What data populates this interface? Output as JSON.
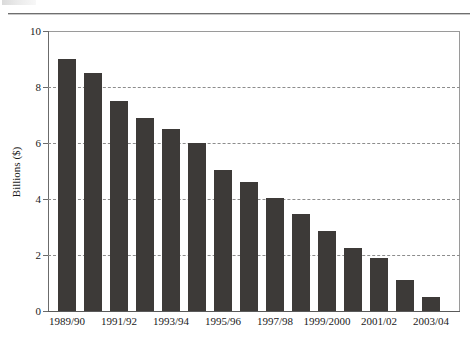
{
  "figure": {
    "background_color": "#ffffff",
    "bar_color": "#3d3a38",
    "grid_color": "#8d8d8d",
    "axis_color": "#6b6b6b"
  },
  "chart_data": {
    "type": "bar",
    "title": "",
    "subtitle": "",
    "xlabel": "",
    "ylabel": "Billions ($)",
    "ylim": [
      0,
      10
    ],
    "yticks": [
      0,
      2,
      4,
      6,
      8,
      10
    ],
    "ytick_labels": [
      "0",
      "2",
      "4",
      "6",
      "8",
      "10"
    ],
    "grid": "horizontal-dashed",
    "legend": "none",
    "categories": [
      "1989/90",
      "1990/91",
      "1991/92",
      "1992/93",
      "1993/94",
      "1994/95",
      "1995/96",
      "1996/97",
      "1997/98",
      "1998/99",
      "1999/2000",
      "2000/01",
      "2001/02",
      "2002/03",
      "2003/04"
    ],
    "visible_tick_labels": [
      "1989/90",
      "1991/92",
      "1993/94",
      "1995/96",
      "1997/98",
      "1999/2000",
      "2001/02",
      "2003/04"
    ],
    "values": [
      9.0,
      8.5,
      7.5,
      6.9,
      6.5,
      6.0,
      5.05,
      4.6,
      4.05,
      3.45,
      2.85,
      2.25,
      1.9,
      1.1,
      0.5
    ],
    "series": [
      {
        "name": "Billions ($)",
        "values": [
          9.0,
          8.5,
          7.5,
          6.9,
          6.5,
          6.0,
          5.05,
          4.6,
          4.05,
          3.45,
          2.85,
          2.25,
          1.9,
          1.1,
          0.5
        ]
      }
    ]
  }
}
